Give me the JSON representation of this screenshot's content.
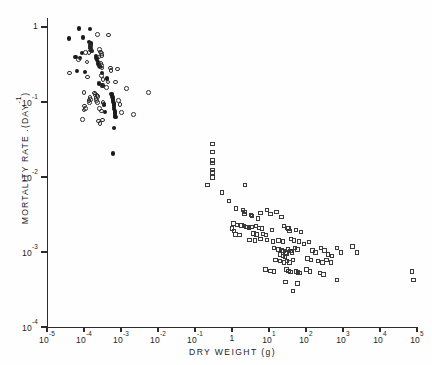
{
  "chart_data": {
    "type": "scatter",
    "title": "",
    "xlabel": "DRY  WEIGHT  (g)",
    "ylabel": "MORTALITY RATE .(DAY",
    "ylabel_exponent": "-1",
    "ylabel_tail": ")",
    "xscale": "log",
    "yscale": "log",
    "xlim": [
      1e-05,
      100000.0
    ],
    "ylim": [
      0.0001,
      1
    ],
    "grid": false,
    "legend": "none",
    "xticks": [
      {
        "value": 1e-05,
        "label": "10",
        "exp": "-5"
      },
      {
        "value": 0.0001,
        "label": "10",
        "exp": "-4"
      },
      {
        "value": 0.001,
        "label": "10",
        "exp": "-3"
      },
      {
        "value": 0.01,
        "label": "10",
        "exp": "-2"
      },
      {
        "value": 0.1,
        "label": "10",
        "exp": "-1"
      },
      {
        "value": 1,
        "label": "1",
        "exp": ""
      },
      {
        "value": 10,
        "label": "10",
        "exp": "1"
      },
      {
        "value": 100,
        "label": "10",
        "exp": "2"
      },
      {
        "value": 1000,
        "label": "10",
        "exp": "3"
      },
      {
        "value": 10000,
        "label": "10",
        "exp": "4"
      },
      {
        "value": 100000,
        "label": "10",
        "exp": "5"
      }
    ],
    "yticks": [
      {
        "value": 1,
        "label": "1",
        "exp": ""
      },
      {
        "value": 0.1,
        "label": "10",
        "exp": "-1"
      },
      {
        "value": 0.01,
        "label": "10",
        "exp": "-2"
      },
      {
        "value": 0.001,
        "label": "10",
        "exp": "-3"
      },
      {
        "value": 0.0001,
        "label": "10",
        "exp": "-4"
      }
    ],
    "series": [
      {
        "name": "filled-circles",
        "marker": "filled-circle",
        "color": "#1a1a1a",
        "count": 46,
        "points": [
          [
            7.4e-05,
            0.95
          ],
          [
            0.00015,
            0.93
          ],
          [
            4e-05,
            0.7
          ],
          [
            9.5e-05,
            0.72
          ],
          [
            0.00014,
            0.62
          ],
          [
            0.000155,
            0.6
          ],
          [
            0.00016,
            0.57
          ],
          [
            0.00015,
            0.55
          ],
          [
            0.000145,
            0.52
          ],
          [
            0.00016,
            0.5
          ],
          [
            0.00017,
            0.47
          ],
          [
            9e-05,
            0.45
          ],
          [
            6e-05,
            0.4
          ],
          [
            8e-05,
            0.38
          ],
          [
            0.00021,
            0.41
          ],
          [
            0.00022,
            0.38
          ],
          [
            0.00023,
            0.36
          ],
          [
            0.00024,
            0.34
          ],
          [
            0.00025,
            0.32
          ],
          [
            0.00026,
            0.3
          ],
          [
            0.00027,
            0.295
          ],
          [
            6.5e-05,
            0.26
          ],
          [
            0.00011,
            0.25
          ],
          [
            0.00031,
            0.245
          ],
          [
            0.00042,
            0.205
          ],
          [
            0.00026,
            0.175
          ],
          [
            0.00032,
            0.165
          ],
          [
            0.00056,
            0.128
          ],
          [
            0.00058,
            0.122
          ],
          [
            0.0006,
            0.116
          ],
          [
            0.00061,
            0.11
          ],
          [
            0.00062,
            0.105
          ],
          [
            0.00063,
            0.1
          ],
          [
            0.00064,
            0.095
          ],
          [
            0.00065,
            0.09
          ],
          [
            0.00066,
            0.085
          ],
          [
            0.00067,
            0.08
          ],
          [
            0.00068,
            0.076
          ],
          [
            0.00069,
            0.072
          ],
          [
            0.0007,
            0.068
          ],
          [
            0.00071,
            0.065
          ],
          [
            0.00072,
            0.062
          ],
          [
            0.00036,
            0.092
          ],
          [
            0.00038,
            0.074
          ],
          [
            0.00066,
            0.0445
          ],
          [
            0.00063,
            0.0205
          ]
        ]
      },
      {
        "name": "open-circles",
        "marker": "open-circle",
        "color": "#2d2d2d",
        "count": 57,
        "points": [
          [
            0.00023,
            0.8
          ],
          [
            0.00046,
            0.78
          ],
          [
            0.000145,
            0.57
          ],
          [
            0.00015,
            0.53
          ],
          [
            0.000155,
            0.49
          ],
          [
            0.000135,
            0.46
          ],
          [
            0.00026,
            0.5
          ],
          [
            0.00028,
            0.465
          ],
          [
            0.0003,
            0.44
          ],
          [
            0.00031,
            0.415
          ],
          [
            0.000255,
            0.4
          ],
          [
            0.00011,
            0.46
          ],
          [
            7e-05,
            0.37
          ],
          [
            0.00012,
            0.34
          ],
          [
            0.00029,
            0.325
          ],
          [
            0.0003,
            0.305
          ],
          [
            0.00031,
            0.285
          ],
          [
            0.00052,
            0.285
          ],
          [
            0.00054,
            0.265
          ],
          [
            0.0008,
            0.275
          ],
          [
            4e-05,
            0.245
          ],
          [
            0.000125,
            0.215
          ],
          [
            0.0003,
            0.225
          ],
          [
            0.00033,
            0.2
          ],
          [
            0.00044,
            0.185
          ],
          [
            0.00072,
            0.185
          ],
          [
            0.00031,
            0.168
          ],
          [
            0.0004,
            0.156
          ],
          [
            0.0001,
            0.135
          ],
          [
            0.00019,
            0.132
          ],
          [
            0.0002,
            0.125
          ],
          [
            0.000225,
            0.122
          ],
          [
            0.00024,
            0.118
          ],
          [
            0.000145,
            0.115
          ],
          [
            0.00015,
            0.108
          ],
          [
            0.000135,
            0.104
          ],
          [
            0.00014,
            0.098
          ],
          [
            0.00021,
            0.112
          ],
          [
            0.00022,
            0.105
          ],
          [
            0.000235,
            0.098
          ],
          [
            0.00033,
            0.098
          ],
          [
            0.00035,
            0.092
          ],
          [
            0.000105,
            0.088
          ],
          [
            0.00011,
            0.082
          ],
          [
            0.0001,
            0.078
          ],
          [
            0.00026,
            0.082
          ],
          [
            0.0003,
            0.076
          ],
          [
            9e-05,
            0.058
          ],
          [
            0.00025,
            0.056
          ],
          [
            0.00027,
            0.052
          ],
          [
            0.00085,
            0.105
          ],
          [
            0.00095,
            0.092
          ],
          [
            0.00105,
            0.072
          ],
          [
            0.0014,
            0.152
          ],
          [
            0.0022,
            0.068
          ],
          [
            0.0055,
            0.135
          ],
          [
            0.00032,
            0.0575
          ]
        ]
      },
      {
        "name": "open-squares",
        "marker": "open-square",
        "color": "#3a3a3a",
        "count": 110,
        "points": [
          [
            0.3,
            0.0275
          ],
          [
            0.3,
            0.0215
          ],
          [
            0.3,
            0.0165
          ],
          [
            0.3,
            0.0152
          ],
          [
            0.3,
            0.0123
          ],
          [
            0.3,
            0.0115
          ],
          [
            0.3,
            0.0098
          ],
          [
            0.22,
            0.0078
          ],
          [
            0.55,
            0.0062
          ],
          [
            0.85,
            0.0048
          ],
          [
            2.3,
            0.0078
          ],
          [
            1.3,
            0.0038
          ],
          [
            2.0,
            0.0036
          ],
          [
            2.2,
            0.0034
          ],
          [
            2.2,
            0.0032
          ],
          [
            3.3,
            0.0031
          ],
          [
            3.5,
            0.003
          ],
          [
            5.0,
            0.0028
          ],
          [
            6.0,
            0.0033
          ],
          [
            9.0,
            0.0036
          ],
          [
            11.0,
            0.0032
          ],
          [
            16.0,
            0.0034
          ],
          [
            22.0,
            0.0029
          ],
          [
            1.1,
            0.0024
          ],
          [
            1.35,
            0.0023
          ],
          [
            1.8,
            0.00225
          ],
          [
            2.1,
            0.0022
          ],
          [
            2.5,
            0.00215
          ],
          [
            2.9,
            0.0021
          ],
          [
            1.0,
            0.00205
          ],
          [
            1.15,
            0.0019
          ],
          [
            3.4,
            0.00215
          ],
          [
            4.5,
            0.0022
          ],
          [
            5.5,
            0.0021
          ],
          [
            6.5,
            0.00205
          ],
          [
            1.25,
            0.0017
          ],
          [
            1.6,
            0.00168
          ],
          [
            3.8,
            0.00175
          ],
          [
            4.6,
            0.0017
          ],
          [
            7.0,
            0.00172
          ],
          [
            8.5,
            0.00168
          ],
          [
            12.0,
            0.00195
          ],
          [
            26.0,
            0.0022
          ],
          [
            32.0,
            0.0021
          ],
          [
            34.0,
            0.00205
          ],
          [
            36.0,
            0.0019
          ],
          [
            55.0,
            0.00195
          ],
          [
            75.0,
            0.00185
          ],
          [
            3.0,
            0.00145
          ],
          [
            4.2,
            0.00142
          ],
          [
            6.0,
            0.00148
          ],
          [
            9.0,
            0.00145
          ],
          [
            13.0,
            0.00138
          ],
          [
            18.0,
            0.00142
          ],
          [
            24.0,
            0.00138
          ],
          [
            40.0,
            0.00148
          ],
          [
            48.0,
            0.00142
          ],
          [
            65.0,
            0.00138
          ],
          [
            90.0,
            0.00128
          ],
          [
            120.0,
            0.00135
          ],
          [
            14.0,
            0.00112
          ],
          [
            18.0,
            0.00108
          ],
          [
            22.0,
            0.00105
          ],
          [
            25.0,
            0.00102
          ],
          [
            28.0,
            0.00098
          ],
          [
            30.0,
            0.00095
          ],
          [
            20.0,
            0.00092
          ],
          [
            24.0,
            0.00088
          ],
          [
            27.0,
            0.00085
          ],
          [
            33.0,
            0.00108
          ],
          [
            38.0,
            0.00102
          ],
          [
            42.0,
            0.00098
          ],
          [
            50.0,
            0.00112
          ],
          [
            60.0,
            0.00108
          ],
          [
            15.0,
            0.00078
          ],
          [
            20.0,
            0.00075
          ],
          [
            26.0,
            0.00072
          ],
          [
            31.0,
            0.00075
          ],
          [
            36.0,
            0.00072
          ],
          [
            45.0,
            0.00078
          ],
          [
            150.0,
            0.00105
          ],
          [
            180.0,
            0.00098
          ],
          [
            260.0,
            0.00112
          ],
          [
            320.0,
            0.00105
          ],
          [
            400.0,
            0.00092
          ],
          [
            500.0,
            0.00088
          ],
          [
            700.0,
            0.00112
          ],
          [
            900.0,
            0.00098
          ],
          [
            110.0,
            0.00082
          ],
          [
            140.0,
            0.00078
          ],
          [
            210.0,
            0.00075
          ],
          [
            280.0,
            0.00072
          ],
          [
            360.0,
            0.00078
          ],
          [
            480.0,
            0.00072
          ],
          [
            1800.0,
            0.00118
          ],
          [
            2400.0,
            0.00098
          ],
          [
            8.0,
            0.00058
          ],
          [
            11.0,
            0.00056
          ],
          [
            14.0,
            0.00055
          ],
          [
            30.0,
            0.00058
          ],
          [
            34.0,
            0.00056
          ],
          [
            38.0,
            0.00054
          ],
          [
            55.0,
            0.00055
          ],
          [
            62.0,
            0.00053
          ],
          [
            70.0,
            0.00052
          ],
          [
            105.0,
            0.00058
          ],
          [
            130.0,
            0.00055
          ],
          [
            240.0,
            0.00052
          ],
          [
            300.0,
            0.0005
          ],
          [
            28.0,
            0.0004
          ],
          [
            60.0,
            0.00038
          ],
          [
            700.0,
            0.00042
          ],
          [
            45.0,
            0.0003
          ],
          [
            75000.0,
            0.00055
          ],
          [
            80000.0,
            0.00042
          ]
        ]
      }
    ]
  }
}
